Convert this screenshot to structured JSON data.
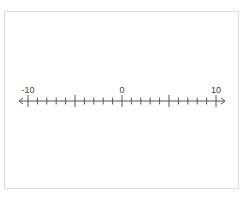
{
  "number_line": {
    "min": -10,
    "max": 10,
    "step": 1,
    "major_every": 5,
    "labels": [
      {
        "value": -10,
        "text": "-10"
      },
      {
        "value": 0,
        "text": "0"
      },
      {
        "value": 10,
        "text": "10"
      }
    ],
    "arrows": [
      "left",
      "right"
    ],
    "line_color": "#555555"
  }
}
